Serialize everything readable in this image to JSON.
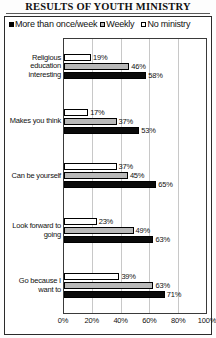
{
  "title": "RESULTS OF YOUTH MINISTRY",
  "legend": {
    "items": [
      {
        "label": "More than once/week",
        "swatch": "black-square-icon"
      },
      {
        "label": "Weekly",
        "swatch": "gray-square-icon"
      },
      {
        "label": "No ministry",
        "swatch": "white-square-icon"
      }
    ]
  },
  "chart_data": {
    "type": "bar",
    "orientation": "horizontal",
    "title": "RESULTS OF YOUTH MINISTRY",
    "xlabel": "",
    "ylabel": "",
    "xlim": [
      0,
      100
    ],
    "xticks": [
      "0%",
      "20%",
      "40%",
      "60%",
      "80%",
      "100%"
    ],
    "xtick_values": [
      0,
      20,
      40,
      60,
      80,
      100
    ],
    "grid": true,
    "legend_position": "top-left",
    "value_suffix": "%",
    "categories": [
      "Religious education interesting",
      "Makes you think",
      "Can be yourself",
      "Look forward to going",
      "Go because I want to"
    ],
    "series": [
      {
        "name": "No ministry",
        "fill": "white",
        "values": [
          19,
          17,
          37,
          23,
          39
        ]
      },
      {
        "name": "Weekly",
        "fill": "gray",
        "values": [
          46,
          37,
          45,
          49,
          63
        ]
      },
      {
        "name": "More than once/week",
        "fill": "black",
        "values": [
          58,
          53,
          65,
          63,
          71
        ]
      }
    ],
    "colors": {
      "black": "#0a0a0a",
      "gray": "#b9b9b9",
      "white": "#ffffff",
      "outline": "#000000"
    }
  },
  "groups": [
    {
      "label_lines": [
        "Religious",
        "education",
        "interesting"
      ],
      "bars": [
        {
          "series": "No ministry",
          "value": 19,
          "value_label": "19%",
          "fill": "white"
        },
        {
          "series": "Weekly",
          "value": 46,
          "value_label": "46%",
          "fill": "gray"
        },
        {
          "series": "More than once/week",
          "value": 58,
          "value_label": "58%",
          "fill": "black"
        }
      ]
    },
    {
      "label_lines": [
        "Makes you think"
      ],
      "bars": [
        {
          "series": "No ministry",
          "value": 17,
          "value_label": "17%",
          "fill": "white"
        },
        {
          "series": "Weekly",
          "value": 37,
          "value_label": "37%",
          "fill": "gray"
        },
        {
          "series": "More than once/week",
          "value": 53,
          "value_label": "53%",
          "fill": "black"
        }
      ]
    },
    {
      "label_lines": [
        "Can be yourself"
      ],
      "bars": [
        {
          "series": "No ministry",
          "value": 37,
          "value_label": "37%",
          "fill": "white"
        },
        {
          "series": "Weekly",
          "value": 45,
          "value_label": "45%",
          "fill": "gray"
        },
        {
          "series": "More than once/week",
          "value": 65,
          "value_label": "65%",
          "fill": "black"
        }
      ]
    },
    {
      "label_lines": [
        "Look forward to",
        "going"
      ],
      "bars": [
        {
          "series": "No ministry",
          "value": 23,
          "value_label": "23%",
          "fill": "white"
        },
        {
          "series": "Weekly",
          "value": 49,
          "value_label": "49%",
          "fill": "gray"
        },
        {
          "series": "More than once/week",
          "value": 63,
          "value_label": "63%",
          "fill": "black"
        }
      ]
    },
    {
      "label_lines": [
        "Go because I",
        "want to"
      ],
      "bars": [
        {
          "series": "No ministry",
          "value": 39,
          "value_label": "39%",
          "fill": "white"
        },
        {
          "series": "Weekly",
          "value": 63,
          "value_label": "63%",
          "fill": "gray"
        },
        {
          "series": "More than once/week",
          "value": 71,
          "value_label": "71%",
          "fill": "black"
        }
      ]
    }
  ]
}
